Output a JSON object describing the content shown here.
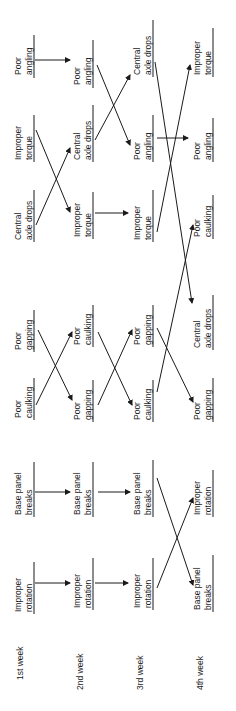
{
  "weeks": [
    {
      "label": "1st week",
      "items": [
        "Poor angling",
        "Improper torque",
        "Central axle drops",
        "Poor gapping",
        "Poor caulking",
        "Base panel breaks",
        "Improper rotation"
      ]
    },
    {
      "label": "2nd week",
      "items": [
        "Poor angling",
        "Central axle drops",
        "Improper torque",
        "Poor caulking",
        "Poor gapping",
        "Base panel breaks",
        "Improper rotation"
      ]
    },
    {
      "label": "3rd week",
      "items": [
        "Central axle drops",
        "Poor angling",
        "Improper torque",
        "Poor gapping",
        "Poor caulking",
        "Base panel breaks",
        "Improper rotation"
      ]
    },
    {
      "label": "4th week",
      "items": [
        "Improper torque",
        "Poor angling",
        "Poor caulking",
        "Central axle drops",
        "Poor gapping",
        "Improper rotation",
        "Base panel breaks"
      ]
    }
  ],
  "labels": {
    "poor_angling": [
      "Poor",
      "angling"
    ],
    "improper_torque": [
      "Improper",
      "torque"
    ],
    "central_axle_drops": [
      "Central",
      "axle drops"
    ],
    "poor_gapping": [
      "Poor",
      "gapping"
    ],
    "poor_caulking": [
      "Poor",
      "caulking"
    ],
    "base_panel_breaks": [
      "Base panel",
      "breaks"
    ],
    "improper_rotation": [
      "Improper",
      "rotation"
    ]
  },
  "colors": {
    "ink": "#1a1a1a",
    "background": "#ffffff"
  }
}
